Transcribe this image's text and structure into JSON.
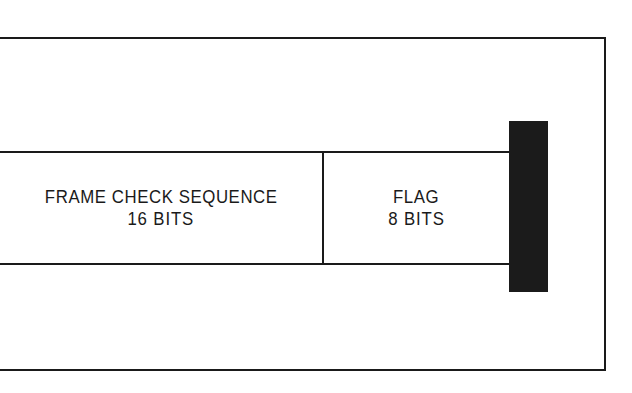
{
  "figure": {
    "kind": "frame-field-diagram",
    "background_color": "#ffffff",
    "ink_color": "#1a1a1a"
  },
  "frame_border": {
    "top_rule": "horizontal rule",
    "right_rule": "vertical rule",
    "bottom_rule": "horizontal rule",
    "left_side": "open"
  },
  "band": {
    "top_rule": "horizontal rule",
    "bottom_rule": "horizontal rule",
    "divider_rule": "vertical rule"
  },
  "fields": [
    {
      "id": "frame-check-sequence",
      "name": "FRAME CHECK SEQUENCE",
      "size": "16 BITS",
      "bits": 16
    },
    {
      "id": "flag",
      "name": "FLAG",
      "size": "8 BITS",
      "bits": 8
    }
  ],
  "terminator": {
    "id": "terminator-block",
    "label": "solid-block-terminator",
    "color": "#1b1b1b"
  }
}
